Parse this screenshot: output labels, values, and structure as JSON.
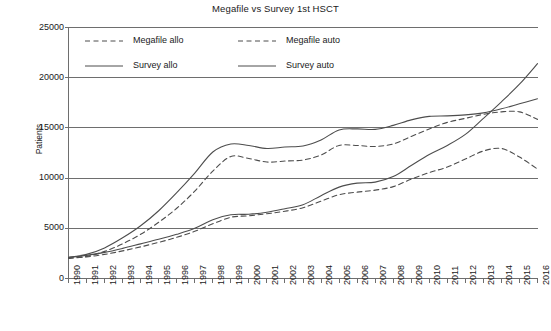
{
  "chart_data": {
    "type": "line",
    "title": "Megafile vs Survey 1st HSCT",
    "xlabel": "",
    "ylabel": "Patients",
    "grid": true,
    "legend_position": "top-left-inside",
    "ylim": [
      0,
      25000
    ],
    "yticks": [
      0,
      5000,
      10000,
      15000,
      20000,
      25000
    ],
    "ytick_labels": [
      "0",
      "5000",
      "10000",
      "15000",
      "20000",
      "25000"
    ],
    "x": [
      1990,
      1991,
      1992,
      1993,
      1994,
      1995,
      1996,
      1997,
      1998,
      1999,
      2000,
      2001,
      2002,
      2003,
      2004,
      2005,
      2006,
      2007,
      2008,
      2009,
      2010,
      2011,
      2012,
      2013,
      2014,
      2015,
      2016
    ],
    "xtick_labels": [
      "1990",
      "1991",
      "1992",
      "1993",
      "1994",
      "1995",
      "1996",
      "1997",
      "1998",
      "1999",
      "2000",
      "2001",
      "2002",
      "2003",
      "2004",
      "2005",
      "2006",
      "2007",
      "2008",
      "2009",
      "2010",
      "2011",
      "2012",
      "2013",
      "2014",
      "2015",
      "2016"
    ],
    "series": [
      {
        "name": "Megafile allo",
        "style": "dashed",
        "color": "#4d4d4d",
        "values": [
          2050,
          2150,
          2400,
          2750,
          3150,
          3600,
          4100,
          4700,
          5450,
          6100,
          6250,
          6450,
          6700,
          7050,
          7700,
          8350,
          8600,
          8800,
          9150,
          9900,
          10550,
          11100,
          11900,
          12700,
          12950,
          12100,
          10900
        ]
      },
      {
        "name": "Megafile auto",
        "style": "dashed",
        "color": "#4d4d4d",
        "values": [
          2000,
          2200,
          2700,
          3450,
          4400,
          5600,
          7000,
          8700,
          10700,
          12150,
          11950,
          11600,
          11700,
          11800,
          12300,
          13250,
          13250,
          13150,
          13400,
          14150,
          14900,
          15550,
          15950,
          16350,
          16600,
          16600,
          15850
        ]
      },
      {
        "name": "Survey allo",
        "style": "solid",
        "color": "#4d4d4d",
        "values": [
          2100,
          2300,
          2600,
          3000,
          3450,
          3900,
          4400,
          5000,
          5850,
          6350,
          6400,
          6600,
          6950,
          7350,
          8250,
          9100,
          9500,
          9600,
          10150,
          11250,
          12350,
          13250,
          14350,
          15950,
          17600,
          19350,
          21400
        ]
      },
      {
        "name": "Survey auto",
        "style": "solid",
        "color": "#4d4d4d",
        "values": [
          2100,
          2400,
          3050,
          4050,
          5250,
          6750,
          8550,
          10500,
          12600,
          13400,
          13250,
          12950,
          13100,
          13200,
          13800,
          14800,
          14900,
          14850,
          15250,
          15800,
          16150,
          16200,
          16300,
          16500,
          16900,
          17400,
          17900
        ]
      }
    ]
  },
  "legend": {
    "items": [
      {
        "label": "Megafile allo",
        "style": "dashed"
      },
      {
        "label": "Megafile auto",
        "style": "dashed"
      },
      {
        "label": "Survey allo",
        "style": "solid"
      },
      {
        "label": "Survey auto",
        "style": "solid"
      }
    ]
  }
}
